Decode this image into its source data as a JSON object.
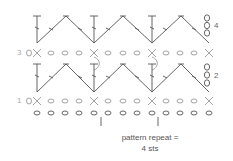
{
  "diagram": {
    "type": "crochet-stitch-chart",
    "colors": {
      "stitch": "#555555",
      "light_stitch": "#9a9a9a"
    },
    "row_labels": [
      {
        "label": "1",
        "side": "left",
        "row": 1
      },
      {
        "label": "2",
        "side": "right",
        "row": 2
      },
      {
        "label": "3",
        "side": "left",
        "row": 3
      },
      {
        "label": "4",
        "side": "right",
        "row": 4
      }
    ],
    "caption": {
      "line1": "pattern repeat =",
      "line2": "4 sts"
    },
    "foundation_chain_count": 13,
    "repeat_stitches": 4
  }
}
